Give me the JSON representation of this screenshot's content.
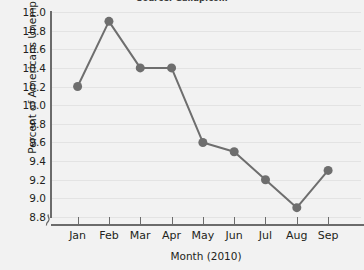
{
  "source_note": "Source: Gallup.com",
  "chart_data": {
    "type": "line",
    "title": "",
    "xlabel": "Month (2010)",
    "ylabel": "Percent of Americans Unemployed",
    "categories": [
      "Jan",
      "Feb",
      "Mar",
      "Apr",
      "May",
      "Jun",
      "Jul",
      "Aug",
      "Sep"
    ],
    "values": [
      10.2,
      10.9,
      10.4,
      10.4,
      9.6,
      9.5,
      9.2,
      8.9,
      9.3
    ],
    "ylim": [
      8.8,
      11.0
    ],
    "ytick_labels": [
      "11.0",
      "10.8",
      "10.6",
      "10.4",
      "10.2",
      "10.0",
      "9.8",
      "9.6",
      "9.4",
      "9.2",
      "9.0",
      "8.8"
    ],
    "ytick_values": [
      11.0,
      10.8,
      10.6,
      10.4,
      10.2,
      10.0,
      9.8,
      9.6,
      9.4,
      9.2,
      9.0,
      8.8
    ],
    "grid": true,
    "grid_axis": "y",
    "legend": false,
    "y_axis_break": true,
    "series_color": "#6e6e6e",
    "marker": "circle",
    "marker_radius": 4.5,
    "line_width": 2,
    "background_color": "#f2f2f2",
    "gridline_color": "#e3e3e3",
    "axis_color": "#6b6b6b",
    "text_color": "#231f20"
  }
}
